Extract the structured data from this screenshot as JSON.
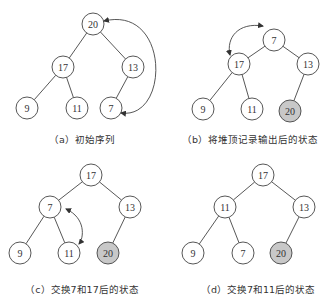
{
  "panels": [
    {
      "id": "a",
      "caption": "（a）初始序列",
      "nodes": [
        {
          "label": "20",
          "x": 93,
          "y": 24,
          "out": false
        },
        {
          "label": "17",
          "x": 63,
          "y": 67,
          "out": false
        },
        {
          "label": "13",
          "x": 133,
          "y": 67,
          "out": false
        },
        {
          "label": "9",
          "x": 27,
          "y": 108,
          "out": false
        },
        {
          "label": "11",
          "x": 77,
          "y": 108,
          "out": false
        },
        {
          "label": "7",
          "x": 111,
          "y": 108,
          "out": false
        }
      ],
      "edges": [
        [
          0,
          1
        ],
        [
          0,
          2
        ],
        [
          1,
          3
        ],
        [
          1,
          4
        ],
        [
          2,
          5
        ]
      ],
      "swap_arrow": {
        "from": "20",
        "to": "7",
        "path": "M104,21 C170,5 170,120 121,113"
      },
      "caption_pos": {
        "x": 82,
        "y": 132
      }
    },
    {
      "id": "b",
      "caption": "（b）将堆顶记录输出后的状态",
      "nodes": [
        {
          "label": "7",
          "x": 274,
          "y": 40,
          "out": false
        },
        {
          "label": "17",
          "x": 239,
          "y": 64,
          "out": false
        },
        {
          "label": "13",
          "x": 308,
          "y": 64,
          "out": false
        },
        {
          "label": "9",
          "x": 203,
          "y": 109,
          "out": false
        },
        {
          "label": "11",
          "x": 252,
          "y": 109,
          "out": false
        },
        {
          "label": "20",
          "x": 290,
          "y": 111,
          "out": true
        }
      ],
      "edges": [
        [
          0,
          1
        ],
        [
          0,
          2
        ],
        [
          1,
          3
        ],
        [
          1,
          4
        ],
        [
          2,
          5
        ]
      ],
      "swap_arrow": {
        "from": "7",
        "to": "17",
        "path": "M263,26 C238,22 226,38 230,55"
      },
      "caption_pos": {
        "x": 250,
        "y": 132
      }
    },
    {
      "id": "c",
      "caption": "（c）交换7和17后的状态",
      "nodes": [
        {
          "label": "17",
          "x": 91,
          "y": 175,
          "out": false
        },
        {
          "label": "7",
          "x": 50,
          "y": 207,
          "out": false
        },
        {
          "label": "13",
          "x": 130,
          "y": 207,
          "out": false
        },
        {
          "label": "9",
          "x": 20,
          "y": 253,
          "out": false
        },
        {
          "label": "11",
          "x": 69,
          "y": 253,
          "out": false
        },
        {
          "label": "20",
          "x": 108,
          "y": 253,
          "out": true
        }
      ],
      "edges": [
        [
          0,
          1
        ],
        [
          0,
          2
        ],
        [
          1,
          3
        ],
        [
          1,
          4
        ],
        [
          2,
          5
        ]
      ],
      "swap_arrow": {
        "from": "7",
        "to": "11",
        "path": "M66,209 C86,218 84,238 79,244"
      },
      "caption_pos": {
        "x": 82,
        "y": 282
      }
    },
    {
      "id": "d",
      "caption": "（d）交换7和11后的状态",
      "nodes": [
        {
          "label": "17",
          "x": 263,
          "y": 175,
          "out": false
        },
        {
          "label": "11",
          "x": 225,
          "y": 207,
          "out": false
        },
        {
          "label": "13",
          "x": 304,
          "y": 207,
          "out": false
        },
        {
          "label": "9",
          "x": 193,
          "y": 253,
          "out": false
        },
        {
          "label": "7",
          "x": 243,
          "y": 253,
          "out": false
        },
        {
          "label": "20",
          "x": 281,
          "y": 253,
          "out": true
        }
      ],
      "edges": [
        [
          0,
          1
        ],
        [
          0,
          2
        ],
        [
          1,
          3
        ],
        [
          1,
          4
        ],
        [
          2,
          5
        ]
      ],
      "swap_arrow": null,
      "caption_pos": {
        "x": 258,
        "y": 282
      }
    }
  ],
  "style": {
    "node_radius": 11,
    "node_fill": "#ffffff",
    "output_node_fill": "#c8c8c8",
    "stroke": "#444444"
  }
}
